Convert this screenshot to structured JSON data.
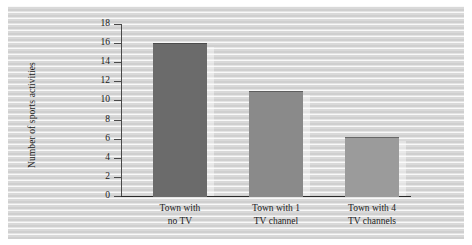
{
  "chart_data": {
    "type": "bar",
    "title": "",
    "xlabel": "",
    "ylabel": "Number of sports activities",
    "categories": [
      "Town with\nno TV",
      "Town with 1\nTV channel",
      "Town with 4\nTV channels"
    ],
    "category_lines": [
      [
        "Town with",
        "no TV"
      ],
      [
        "Town with 1",
        "TV channel"
      ],
      [
        "Town with 4",
        "TV channels"
      ]
    ],
    "values": [
      16,
      11,
      6.2
    ],
    "ylim": [
      0,
      18
    ],
    "ytick_step": 2,
    "yticks": [
      0,
      2,
      4,
      6,
      8,
      10,
      12,
      14,
      16,
      18
    ],
    "ytick_labels": [
      "0",
      "2",
      "4",
      "6",
      "8",
      "10",
      "12",
      "14",
      "16",
      "18"
    ],
    "grid": false,
    "legend": false,
    "bar_colors": [
      "#6b6b6b",
      "#8a8a8a",
      "#9b9b9b"
    ]
  },
  "figure": {
    "panel_background": "#d8d8d8",
    "axis_color": "#2b2b2b",
    "text_color": "#1c1c1c"
  }
}
